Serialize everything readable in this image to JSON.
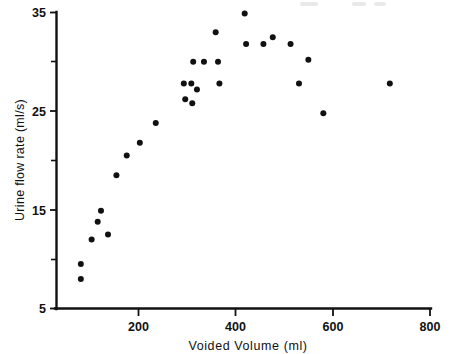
{
  "chart_data": {
    "type": "scatter",
    "title": "",
    "xlabel": "Voided Volume (ml)",
    "ylabel": "Urine flow rate (ml/s)",
    "xlim": [
      0,
      800
    ],
    "ylim": [
      5,
      35
    ],
    "grid": false,
    "legend": null,
    "x_ticks": [
      200,
      400,
      600,
      800
    ],
    "x_tick_labels": [
      "200",
      "400",
      "600",
      "800"
    ],
    "x_minor_ticks": [],
    "y_ticks": [
      5,
      15,
      25,
      35
    ],
    "y_tick_labels": [
      "5",
      "15",
      "25",
      "35"
    ],
    "y_minor_ticks": [
      10,
      20,
      30
    ],
    "marker": "filled-circle",
    "marker_color": "#111111",
    "marker_size": 3.0,
    "series": [
      {
        "name": "Subjects",
        "points": [
          [
            52,
            8.0
          ],
          [
            52,
            9.5
          ],
          [
            75,
            12.0
          ],
          [
            88,
            13.8
          ],
          [
            95,
            14.9
          ],
          [
            110,
            12.5
          ],
          [
            128,
            18.5
          ],
          [
            150,
            20.5
          ],
          [
            178,
            21.8
          ],
          [
            212,
            23.8
          ],
          [
            272,
            27.8
          ],
          [
            275,
            26.2
          ],
          [
            288,
            27.8
          ],
          [
            290,
            25.8
          ],
          [
            292,
            30.0
          ],
          [
            300,
            27.2
          ],
          [
            315,
            30.0
          ],
          [
            340,
            33.0
          ],
          [
            345,
            30.0
          ],
          [
            348,
            27.8
          ],
          [
            402,
            34.9
          ],
          [
            405,
            31.8
          ],
          [
            442,
            31.8
          ],
          [
            462,
            32.5
          ],
          [
            500,
            31.8
          ],
          [
            518,
            27.8
          ],
          [
            538,
            30.2
          ],
          [
            570,
            24.8
          ],
          [
            712,
            27.8
          ]
        ]
      }
    ],
    "n_points": 29
  },
  "axes": {
    "x_title": "Voided Volume (ml)",
    "y_title": "Urine flow rate (ml/s)"
  },
  "tick_text": {
    "y": [
      "35",
      "25",
      "15",
      "5"
    ],
    "x": [
      "200",
      "400",
      "600",
      "800"
    ]
  }
}
